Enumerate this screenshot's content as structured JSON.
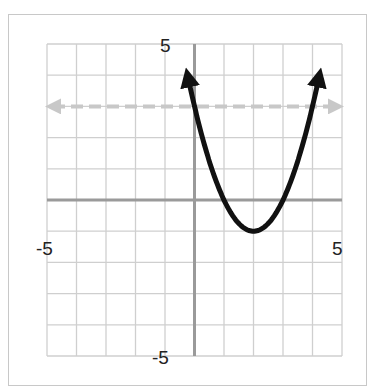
{
  "chart_data": {
    "type": "line",
    "title": "",
    "xlabel": "",
    "ylabel": "",
    "xlim": [
      -5,
      5
    ],
    "ylim": [
      -5,
      5
    ],
    "grid": true,
    "tick_labels": {
      "x_min": "-5",
      "x_max": "5",
      "y_min": "-5",
      "y_max": "5"
    },
    "series": [
      {
        "name": "parabola",
        "equation": "y = (x-2)^2 - 1",
        "style": "solid-black-arrows",
        "vertex": [
          2,
          -1
        ],
        "x": [
          -0.25,
          0,
          1,
          2,
          3,
          4,
          4.25
        ],
        "y": [
          4.06,
          3,
          0,
          -1,
          0,
          3,
          4.06
        ]
      },
      {
        "name": "horizontal-line",
        "equation": "y = 3",
        "style": "dashed-gray-arrows",
        "x": [
          -5,
          5
        ],
        "y": [
          3,
          3
        ]
      }
    ]
  },
  "labels": {
    "y_top": "5",
    "y_bottom": "-5",
    "x_left": "-5",
    "x_right": "5"
  },
  "colors": {
    "grid": "#cfcfcf",
    "axis": "#9a9a9a",
    "curve": "#111111",
    "dashed": "#c8c8c8"
  }
}
